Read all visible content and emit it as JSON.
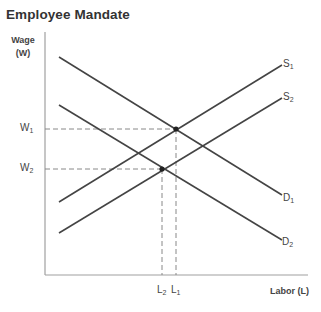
{
  "title": "Employee Mandate",
  "axes": {
    "y_label_line1": "Wage",
    "y_label_line2": "(W)",
    "x_label": "Labor (L)"
  },
  "curves": {
    "S1": {
      "base": "S",
      "sub": "1"
    },
    "S2": {
      "base": "S",
      "sub": "2"
    },
    "D1": {
      "base": "D",
      "sub": "1"
    },
    "D2": {
      "base": "D",
      "sub": "2"
    }
  },
  "equilibria": {
    "W1": {
      "base": "W",
      "sub": "1"
    },
    "W2": {
      "base": "W",
      "sub": "2"
    },
    "L1": {
      "base": "L",
      "sub": "1"
    },
    "L2": {
      "base": "L",
      "sub": "2"
    }
  },
  "colors": {
    "line": "#444444",
    "axis": "#999999",
    "dashed": "#888888"
  }
}
